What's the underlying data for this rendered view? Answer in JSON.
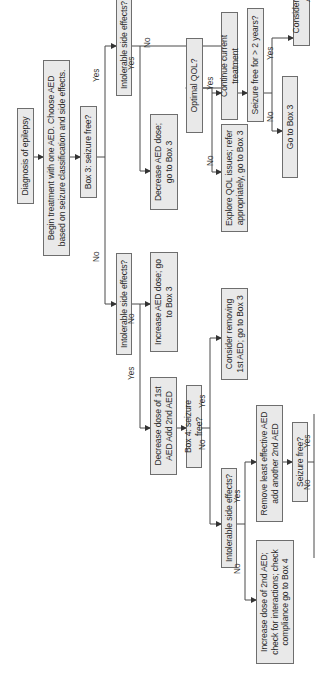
{
  "colors": {
    "box_fill": "#e9e9e9",
    "box_border": "#6e6e6e",
    "line": "#4a4a4a",
    "text": "#2a2a2a"
  },
  "nodes": {
    "diagnosis": "Diagnosis of epilepsy",
    "begin_treatment": "Begin treatment with one AED. Choose AED based on seizure classification and side effects.",
    "box3_seizure_free": "Box 3: seizure free?",
    "intolerable_se_no_branch": "Intolerable side effects?",
    "increase_aed_dose": "Increase AED dose; go to Box 3",
    "decrease_add_2nd": "Decrease dose of 1st AED Add 2nd AED",
    "box4_seizure_free": "Box 4: seizure free?",
    "consider_removing_1st": "Consider removing 1st AED; go to Box 3",
    "intolerable_se_box4": "Intolerable side effects?",
    "remove_least_effective": "Remove least effective AED add another 2nd AED",
    "increase_2nd_dose": "Increase dose of 2nd AED; check for interactions; check compliance go to Box 4",
    "seizure_free_q": "Seizure free?",
    "continue_rx": "Continue current Rx or go to Box 4",
    "reconfirm_diagnosis": "Reconfirm diagnosis; consider surgery or other AEDs",
    "intolerable_se_yes_branch": "Intolerable side effects?",
    "decrease_aed_dose": "Decrease AED dose; go to Box 3",
    "optimal_qol": "Optimal QOL?",
    "explore_qol": "Explore QOL issues; refer appropriately, go to Box 3",
    "continue_treatment": "Continue current treatment",
    "seizure_free_2yrs": "Seizure free for > 2 years?",
    "go_to_box3": "Go to Box 3",
    "consider_withdrawal": "Consider withdrawal of AEDs"
  },
  "edge_labels": {
    "box3_no": "No",
    "box3_yes": "Yes",
    "ise_no_branch_yes": "Yes",
    "ise_no_branch_no": "No",
    "box4_yes": "Yes",
    "box4_no": "No",
    "ise_box4_yes": "Yes",
    "ise_box4_no": "No",
    "sf_yes": "Yes",
    "sf_no": "No",
    "ise_yes_branch_yes": "Yes",
    "ise_yes_branch_no": "No",
    "qol_yes": "Yes",
    "qol_no": "No",
    "sf2_yes": "Yes",
    "sf2_no": "No"
  }
}
